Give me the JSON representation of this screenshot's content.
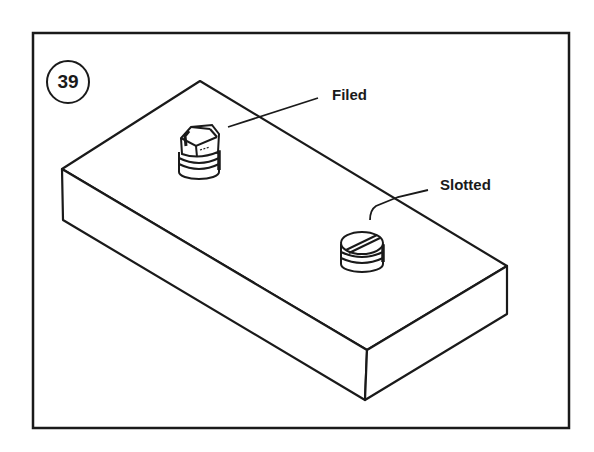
{
  "figure": {
    "number": "39",
    "labels": {
      "filed": "Filed",
      "slotted": "Slotted"
    }
  },
  "colors": {
    "ink": "#1a1a1a",
    "background": "#ffffff"
  }
}
